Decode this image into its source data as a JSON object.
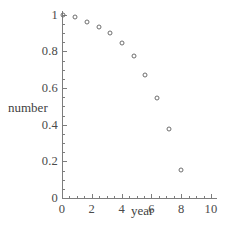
{
  "chart_data": {
    "type": "scatter",
    "title": "",
    "xlabel": "year",
    "ylabel": "number",
    "xlim": [
      0,
      10.4
    ],
    "ylim": [
      0,
      1.02
    ],
    "grid": false,
    "legend": null,
    "x": [
      0.05,
      0.85,
      1.65,
      2.45,
      3.2,
      4.0,
      4.8,
      5.6,
      6.4,
      7.2,
      8.0
    ],
    "y": [
      1.0,
      0.985,
      0.96,
      0.935,
      0.9,
      0.845,
      0.775,
      0.67,
      0.545,
      0.375,
      0.155
    ],
    "points": [
      {
        "x": 0.05,
        "y": 1.0
      },
      {
        "x": 0.85,
        "y": 0.985
      },
      {
        "x": 1.65,
        "y": 0.96
      },
      {
        "x": 2.45,
        "y": 0.935
      },
      {
        "x": 3.2,
        "y": 0.9
      },
      {
        "x": 4.0,
        "y": 0.845
      },
      {
        "x": 4.8,
        "y": 0.775
      },
      {
        "x": 5.6,
        "y": 0.67
      },
      {
        "x": 6.4,
        "y": 0.545
      },
      {
        "x": 7.2,
        "y": 0.375
      },
      {
        "x": 8.0,
        "y": 0.155
      }
    ],
    "xticks": [
      {
        "value": 0,
        "label": "0"
      },
      {
        "value": 2,
        "label": "2"
      },
      {
        "value": 4,
        "label": "4"
      },
      {
        "value": 6,
        "label": "6"
      },
      {
        "value": 8,
        "label": "8"
      },
      {
        "value": 10,
        "label": "10"
      }
    ],
    "yticks": [
      {
        "value": 0,
        "label": "0"
      },
      {
        "value": 0.2,
        "label": "0.2"
      },
      {
        "value": 0.4,
        "label": "0.4"
      },
      {
        "value": 0.6,
        "label": "0.6"
      },
      {
        "value": 0.8,
        "label": "0.8"
      },
      {
        "value": 1.0,
        "label": "1"
      }
    ],
    "marker_color": "#6e6e6e",
    "axis_color": "#7d7d7d",
    "background": "#ffffff"
  }
}
